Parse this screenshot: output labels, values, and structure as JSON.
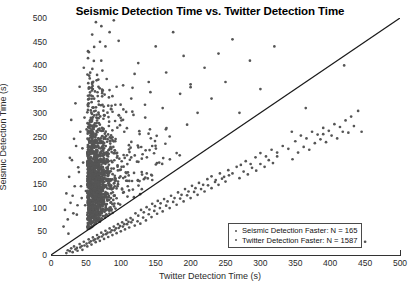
{
  "chart_data": {
    "type": "scatter",
    "title": "Seismic Detection Time vs. Twitter Detection Time",
    "xlabel": "Twitter Detection Time (s)",
    "ylabel": "Seismic Detection Time (s)",
    "xlim": [
      0,
      500
    ],
    "ylim": [
      0,
      500
    ],
    "xticks": [
      0,
      50,
      100,
      150,
      200,
      250,
      300,
      350,
      400,
      450,
      500
    ],
    "yticks": [
      0,
      50,
      100,
      150,
      200,
      250,
      300,
      350,
      400,
      450,
      500
    ],
    "grid": false,
    "legend_position": "lower-right",
    "marker_color": "#555555",
    "marker_size": 2,
    "reference_line": {
      "name": "y = x identity line",
      "from": [
        0,
        0
      ],
      "to": [
        500,
        500
      ],
      "color": "#1a1a1a"
    },
    "series": [
      {
        "name": "Seismic Detection Faster",
        "count": 165,
        "region": "below the y = x line",
        "points": [
          [
            22,
            4
          ],
          [
            27,
            8
          ],
          [
            31,
            6
          ],
          [
            35,
            12
          ],
          [
            38,
            9
          ],
          [
            42,
            16
          ],
          [
            45,
            11
          ],
          [
            48,
            20
          ],
          [
            52,
            18
          ],
          [
            55,
            26
          ],
          [
            58,
            22
          ],
          [
            61,
            31
          ],
          [
            64,
            27
          ],
          [
            67,
            35
          ],
          [
            70,
            30
          ],
          [
            73,
            39
          ],
          [
            76,
            34
          ],
          [
            79,
            44
          ],
          [
            82,
            38
          ],
          [
            85,
            48
          ],
          [
            88,
            42
          ],
          [
            91,
            52
          ],
          [
            94,
            46
          ],
          [
            97,
            57
          ],
          [
            100,
            50
          ],
          [
            103,
            60
          ],
          [
            106,
            54
          ],
          [
            109,
            65
          ],
          [
            112,
            58
          ],
          [
            115,
            69
          ],
          [
            24,
            10
          ],
          [
            29,
            14
          ],
          [
            33,
            18
          ],
          [
            37,
            15
          ],
          [
            41,
            23
          ],
          [
            44,
            19
          ],
          [
            47,
            28
          ],
          [
            51,
            24
          ],
          [
            54,
            33
          ],
          [
            57,
            29
          ],
          [
            60,
            37
          ],
          [
            63,
            33
          ],
          [
            66,
            42
          ],
          [
            69,
            38
          ],
          [
            72,
            47
          ],
          [
            75,
            43
          ],
          [
            78,
            51
          ],
          [
            81,
            47
          ],
          [
            84,
            56
          ],
          [
            87,
            52
          ],
          [
            90,
            60
          ],
          [
            93,
            56
          ],
          [
            96,
            65
          ],
          [
            99,
            61
          ],
          [
            102,
            69
          ],
          [
            105,
            65
          ],
          [
            108,
            74
          ],
          [
            111,
            70
          ],
          [
            114,
            78
          ],
          [
            117,
            74
          ],
          [
            120,
            62
          ],
          [
            124,
            71
          ],
          [
            128,
            66
          ],
          [
            132,
            79
          ],
          [
            136,
            73
          ],
          [
            140,
            86
          ],
          [
            144,
            80
          ],
          [
            148,
            93
          ],
          [
            152,
            87
          ],
          [
            156,
            99
          ],
          [
            121,
            88
          ],
          [
            125,
            83
          ],
          [
            129,
            95
          ],
          [
            133,
            90
          ],
          [
            137,
            101
          ],
          [
            141,
            96
          ],
          [
            145,
            108
          ],
          [
            149,
            103
          ],
          [
            153,
            114
          ],
          [
            157,
            109
          ],
          [
            160,
            92
          ],
          [
            165,
            104
          ],
          [
            170,
            99
          ],
          [
            175,
            112
          ],
          [
            180,
            106
          ],
          [
            185,
            119
          ],
          [
            190,
            113
          ],
          [
            195,
            126
          ],
          [
            200,
            120
          ],
          [
            205,
            133
          ],
          [
            162,
            118
          ],
          [
            167,
            113
          ],
          [
            172,
            125
          ],
          [
            177,
            120
          ],
          [
            182,
            132
          ],
          [
            187,
            127
          ],
          [
            192,
            139
          ],
          [
            197,
            134
          ],
          [
            202,
            146
          ],
          [
            207,
            141
          ],
          [
            210,
            127
          ],
          [
            215,
            139
          ],
          [
            220,
            134
          ],
          [
            225,
            147
          ],
          [
            230,
            141
          ],
          [
            235,
            154
          ],
          [
            240,
            148
          ],
          [
            245,
            161
          ],
          [
            250,
            155
          ],
          [
            255,
            168
          ],
          [
            212,
            152
          ],
          [
            218,
            148
          ],
          [
            224,
            160
          ],
          [
            230,
            166
          ],
          [
            236,
            158
          ],
          [
            242,
            172
          ],
          [
            248,
            165
          ],
          [
            254,
            179
          ],
          [
            260,
            172
          ],
          [
            266,
            186
          ],
          [
            270,
            162
          ],
          [
            276,
            176
          ],
          [
            282,
            170
          ],
          [
            288,
            184
          ],
          [
            294,
            178
          ],
          [
            300,
            192
          ],
          [
            306,
            186
          ],
          [
            312,
            200
          ],
          [
            318,
            194
          ],
          [
            324,
            208
          ],
          [
            272,
            190
          ],
          [
            279,
            198
          ],
          [
            286,
            192
          ],
          [
            293,
            206
          ],
          [
            300,
            215
          ],
          [
            308,
            208
          ],
          [
            316,
            222
          ],
          [
            324,
            216
          ],
          [
            332,
            230
          ],
          [
            340,
            224
          ],
          [
            346,
            202
          ],
          [
            354,
            216
          ],
          [
            362,
            228
          ],
          [
            370,
            222
          ],
          [
            378,
            236
          ],
          [
            386,
            244
          ],
          [
            394,
            238
          ],
          [
            402,
            252
          ],
          [
            410,
            246
          ],
          [
            418,
            260
          ],
          [
            350,
            240
          ],
          [
            358,
            252
          ],
          [
            366,
            246
          ],
          [
            374,
            260
          ],
          [
            382,
            254
          ],
          [
            390,
            268
          ],
          [
            398,
            262
          ],
          [
            406,
            276
          ],
          [
            414,
            270
          ],
          [
            422,
            284
          ],
          [
            430,
            292
          ],
          [
            440,
            304
          ],
          [
            450,
            28
          ],
          [
            426,
            258
          ],
          [
            434,
            272
          ]
        ]
      },
      {
        "name": "Twitter Detection Faster",
        "count": 1587,
        "region": "above the y = x line",
        "density_note": "dense cluster centered near x = 20-90 s, y = 60-220 s, with a long upper tail to 500 s",
        "cluster": {
          "x_center": 52,
          "y_center": 140,
          "x_spread": 30,
          "y_spread": 70
        },
        "sample_points": [
          [
            18,
            60
          ],
          [
            20,
            95
          ],
          [
            22,
            130
          ],
          [
            24,
            75
          ],
          [
            26,
            165
          ],
          [
            28,
            110
          ],
          [
            30,
            200
          ],
          [
            32,
            88
          ],
          [
            34,
            145
          ],
          [
            36,
            230
          ],
          [
            38,
            105
          ],
          [
            40,
            175
          ],
          [
            42,
            260
          ],
          [
            44,
            120
          ],
          [
            46,
            195
          ],
          [
            48,
            290
          ],
          [
            50,
            135
          ],
          [
            52,
            215
          ],
          [
            54,
            320
          ],
          [
            56,
            150
          ],
          [
            58,
            235
          ],
          [
            60,
            350
          ],
          [
            62,
            165
          ],
          [
            64,
            255
          ],
          [
            66,
            380
          ],
          [
            68,
            180
          ],
          [
            70,
            275
          ],
          [
            72,
            410
          ],
          [
            74,
            195
          ],
          [
            76,
            295
          ],
          [
            78,
            440
          ],
          [
            80,
            210
          ],
          [
            82,
            315
          ],
          [
            84,
            470
          ],
          [
            86,
            225
          ],
          [
            88,
            335
          ],
          [
            90,
            495
          ],
          [
            92,
            240
          ],
          [
            94,
            355
          ],
          [
            96,
            155
          ],
          [
            25,
            45
          ],
          [
            27,
            205
          ],
          [
            29,
            285
          ],
          [
            31,
            125
          ],
          [
            33,
            245
          ],
          [
            35,
            320
          ],
          [
            37,
            85
          ],
          [
            39,
            185
          ],
          [
            41,
            355
          ],
          [
            43,
            145
          ],
          [
            45,
            225
          ],
          [
            47,
            395
          ],
          [
            49,
            105
          ],
          [
            51,
            265
          ],
          [
            53,
            430
          ],
          [
            55,
            165
          ],
          [
            57,
            305
          ],
          [
            59,
            465
          ],
          [
            61,
            125
          ],
          [
            63,
            345
          ],
          [
            100,
            180
          ],
          [
            105,
            260
          ],
          [
            110,
            145
          ],
          [
            115,
            330
          ],
          [
            120,
            210
          ],
          [
            125,
            405
          ],
          [
            130,
            175
          ],
          [
            135,
            290
          ],
          [
            140,
            365
          ],
          [
            145,
            230
          ],
          [
            150,
            440
          ],
          [
            155,
            195
          ],
          [
            160,
            310
          ],
          [
            165,
            385
          ],
          [
            170,
            250
          ],
          [
            175,
            470
          ],
          [
            180,
            215
          ],
          [
            185,
            340
          ],
          [
            190,
            420
          ],
          [
            195,
            275
          ],
          [
            200,
            360
          ],
          [
            210,
            300
          ],
          [
            220,
            395
          ],
          [
            230,
            330
          ],
          [
            240,
            425
          ],
          [
            250,
            365
          ],
          [
            260,
            455
          ],
          [
            270,
            300
          ],
          [
            285,
            410
          ],
          [
            300,
            350
          ],
          [
            320,
            440
          ],
          [
            345,
            260
          ],
          [
            365,
            310
          ],
          [
            390,
            255
          ],
          [
            420,
            400
          ],
          [
            445,
            260
          ]
        ]
      }
    ]
  },
  "legend": {
    "entries": [
      {
        "label": "Seismic Detection Faster: N = 165"
      },
      {
        "label": "Twitter Detection Faster: N = 1587"
      }
    ]
  }
}
